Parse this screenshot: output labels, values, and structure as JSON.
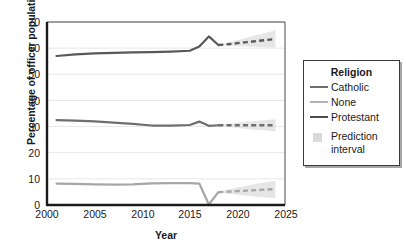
{
  "chart_data": {
    "type": "line",
    "title": "",
    "xlabel": "Year",
    "ylabel": "Percentage of officer population",
    "xlim": [
      2000,
      2025
    ],
    "ylim": [
      0,
      70
    ],
    "xticks": [
      2000,
      2005,
      2010,
      2015,
      2020,
      2025
    ],
    "yticks": [
      0,
      10,
      20,
      30,
      40,
      50,
      60,
      70
    ],
    "grid": "horizontal",
    "legend_position": "right",
    "legend_title": "Religion",
    "x": [
      2001,
      2003,
      2005,
      2007,
      2009,
      2011,
      2013,
      2015,
      2016,
      2017,
      2018
    ],
    "forecast_x": [
      2018,
      2019,
      2020,
      2021,
      2022,
      2023,
      2024
    ],
    "series": [
      {
        "name": "Protestant",
        "color": "#595959",
        "values": [
          57.0,
          57.6,
          58.0,
          58.2,
          58.4,
          58.5,
          58.7,
          59.0,
          60.6,
          64.5,
          61.2
        ],
        "forecast": [
          61.2,
          61.5,
          61.9,
          62.3,
          62.7,
          63.1,
          63.5
        ],
        "interval_low": [
          61.2,
          60.9,
          60.7,
          60.6,
          60.4,
          60.3,
          60.2
        ],
        "interval_high": [
          61.2,
          62.1,
          63.1,
          64.0,
          65.0,
          65.9,
          66.8
        ]
      },
      {
        "name": "Catholic",
        "color": "#6e6e6e",
        "values": [
          32.5,
          32.3,
          32.0,
          31.5,
          31.0,
          30.4,
          30.4,
          30.6,
          31.9,
          30.3,
          30.5
        ],
        "forecast": [
          30.5,
          30.5,
          30.5,
          30.5,
          30.5,
          30.5,
          30.5
        ],
        "interval_low": [
          30.5,
          29.9,
          29.5,
          29.1,
          28.8,
          28.5,
          28.2
        ],
        "interval_high": [
          30.5,
          31.1,
          31.5,
          31.9,
          32.2,
          32.5,
          32.8
        ]
      },
      {
        "name": "None",
        "color": "#a6a6a6",
        "values": [
          8.2,
          8.1,
          7.9,
          7.8,
          7.9,
          8.3,
          8.4,
          8.4,
          8.2,
          0.2,
          4.9
        ],
        "forecast": [
          4.9,
          5.1,
          5.3,
          5.5,
          5.7,
          5.9,
          6.1
        ],
        "interval_low": [
          4.9,
          4.3,
          3.9,
          3.5,
          3.2,
          2.9,
          2.6
        ],
        "interval_high": [
          4.9,
          5.9,
          6.7,
          7.4,
          8.1,
          8.7,
          9.3
        ]
      }
    ],
    "legend_entries": [
      {
        "label": "Catholic",
        "color": "#6e6e6e",
        "marker": "line"
      },
      {
        "label": "None",
        "color": "#a6a6a6",
        "marker": "line"
      },
      {
        "label": "Protestant",
        "color": "#595959",
        "marker": "line"
      },
      {
        "label": "Prediction interval",
        "color": "#d9d9d9",
        "marker": "box"
      }
    ],
    "interval_band_color": "#e2e2e2"
  },
  "axes": {
    "yticks_text": [
      "0",
      "10",
      "20",
      "30",
      "40",
      "50",
      "60",
      "70"
    ],
    "xticks_text": [
      "2000",
      "2005",
      "2010",
      "2015",
      "2020",
      "2025"
    ],
    "xlabel": "Year",
    "ylabel": "Percentage of officer population"
  },
  "legend": {
    "title": "Religion",
    "items": [
      {
        "label": "Catholic"
      },
      {
        "label": "None"
      },
      {
        "label": "Protestant"
      },
      {
        "label": "Prediction"
      },
      {
        "label": "interval"
      }
    ]
  }
}
